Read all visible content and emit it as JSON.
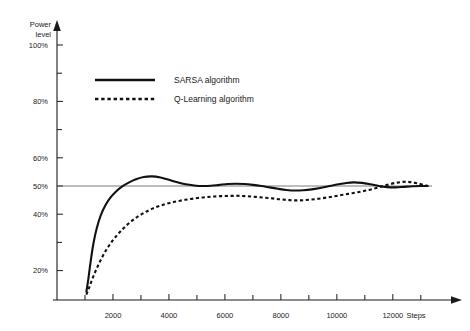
{
  "chart_data": {
    "type": "line",
    "title": "",
    "xlabel": "Steps",
    "ylabel": "Power level",
    "xlim": [
      0,
      13400
    ],
    "ylim": [
      10,
      103
    ],
    "grid": false,
    "legend_position": "upper-left-inside",
    "reference_line": {
      "value": 50,
      "label": "50%"
    },
    "x_ticks": [
      2000,
      4000,
      6000,
      8000,
      10000,
      12000
    ],
    "x_tick_labels": [
      "2000",
      "4000",
      "6000",
      "8000",
      "10000",
      "12000"
    ],
    "x_minor_ticks": [
      1000,
      3000,
      5000,
      7000,
      9000,
      11000,
      13000
    ],
    "y_ticks": [
      20,
      40,
      50,
      60,
      80,
      100
    ],
    "y_tick_labels": [
      "20%",
      "40%",
      "50%",
      "60%",
      "80%",
      "100%"
    ],
    "y_minor_ticks": [
      30,
      70,
      90
    ],
    "series": [
      {
        "name": "SARSA algorithm",
        "style": "solid",
        "color": "#111111",
        "x": [
          1050,
          1120,
          1200,
          1300,
          1420,
          1560,
          1720,
          1900,
          2100,
          2320,
          2560,
          2820,
          3100,
          3400,
          3700,
          4000,
          4300,
          4600,
          4900,
          5200,
          5500,
          5800,
          6100,
          6400,
          6700,
          7000,
          7300,
          7600,
          7900,
          8200,
          8500,
          8800,
          9100,
          9400,
          9700,
          10000,
          10300,
          10600,
          10900,
          11200,
          11500,
          11800,
          12100,
          12400,
          12700,
          13000,
          13250
        ],
        "y": [
          12.5,
          17.0,
          23.0,
          29.5,
          35.0,
          39.5,
          43.0,
          45.8,
          48.0,
          49.8,
          51.2,
          52.4,
          53.2,
          53.4,
          53.0,
          52.2,
          51.3,
          50.6,
          50.2,
          50.0,
          50.1,
          50.4,
          50.7,
          50.8,
          50.7,
          50.4,
          50.0,
          49.5,
          49.0,
          48.6,
          48.4,
          48.5,
          48.8,
          49.3,
          49.9,
          50.5,
          51.0,
          51.3,
          51.1,
          50.6,
          50.0,
          49.6,
          49.5,
          49.7,
          49.9,
          50.0,
          50.0
        ]
      },
      {
        "name": "Q-Learning algorithm",
        "style": "dashed",
        "color": "#111111",
        "x": [
          1050,
          1150,
          1280,
          1430,
          1600,
          1790,
          2000,
          2230,
          2480,
          2750,
          3040,
          3350,
          3680,
          4030,
          4400,
          4780,
          5150,
          5500,
          5850,
          6200,
          6550,
          6900,
          7250,
          7600,
          7950,
          8300,
          8650,
          9000,
          9350,
          9700,
          10050,
          10400,
          10750,
          11100,
          11450,
          11800,
          12150,
          12500,
          12850,
          13250
        ],
        "y": [
          11.5,
          14.0,
          17.5,
          21.0,
          24.5,
          27.8,
          30.8,
          33.5,
          36.0,
          38.2,
          40.1,
          41.7,
          43.0,
          44.0,
          44.8,
          45.4,
          45.9,
          46.2,
          46.4,
          46.5,
          46.5,
          46.3,
          46.0,
          45.7,
          45.3,
          45.0,
          44.9,
          45.1,
          45.5,
          46.0,
          46.6,
          47.2,
          47.8,
          48.5,
          49.4,
          50.4,
          51.2,
          51.5,
          51.0,
          50.0
        ]
      }
    ]
  },
  "axes": {
    "y_title_line1": "Power",
    "y_title_line2": "level",
    "x_title": "Steps"
  },
  "legend": {
    "items": [
      {
        "label": "SARSA algorithm",
        "style": "solid"
      },
      {
        "label": "Q-Learning algorithm",
        "style": "dashed"
      }
    ]
  },
  "colors": {
    "axis": "#1a1a1a",
    "series": "#111111",
    "reference": "#5a5a5a",
    "background": "#ffffff"
  }
}
